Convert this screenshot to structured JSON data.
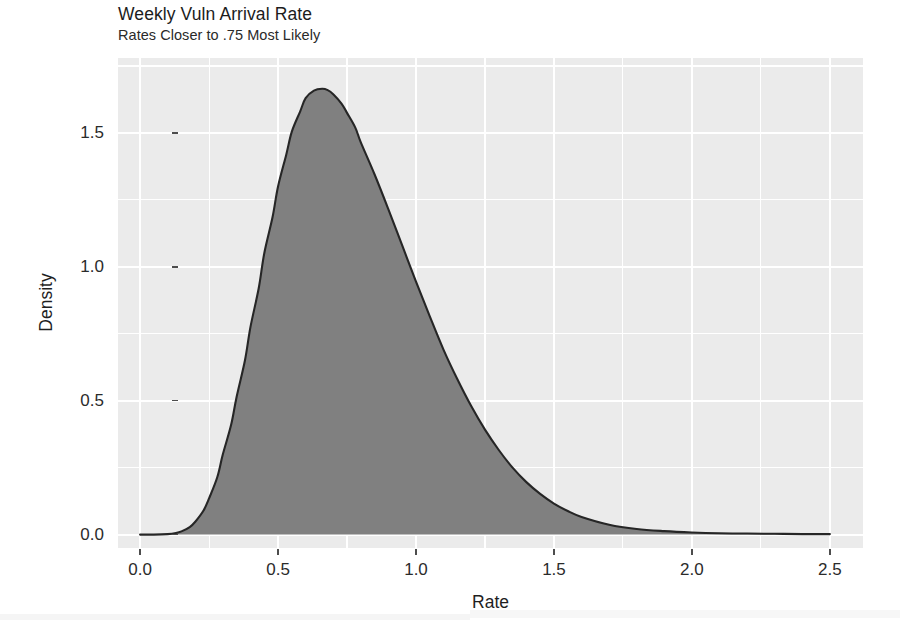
{
  "chart_data": {
    "type": "area",
    "title": "Weekly Vuln Arrival Rate",
    "subtitle": "Rates Closer to .75 Most Likely",
    "xlabel": "Rate",
    "ylabel": "Density",
    "xlim": [
      -0.08,
      2.62
    ],
    "ylim": [
      -0.05,
      1.78
    ],
    "xticks": [
      0.0,
      0.5,
      1.0,
      1.5,
      2.0,
      2.5
    ],
    "xticklabels": [
      "0.0",
      "0.5",
      "1.0",
      "1.5",
      "2.0",
      "2.5"
    ],
    "yticks": [
      0.0,
      0.5,
      1.0,
      1.5
    ],
    "yticklabels": [
      "0.0",
      "0.5",
      "1.0",
      "1.5"
    ],
    "grid": true,
    "minor_grid": true,
    "legend": "none",
    "fill_color": "#808080",
    "line_color": "#262626",
    "panel_background": "#ebebeb",
    "gridline_color": "#ffffff",
    "peak": {
      "x": 0.66,
      "y": 1.66
    },
    "annotation": "Posterior density of weekly vulnerability arrival rate; mode near 0.75",
    "x": [
      0.0,
      0.05,
      0.1,
      0.13,
      0.15,
      0.18,
      0.2,
      0.23,
      0.25,
      0.28,
      0.3,
      0.33,
      0.35,
      0.38,
      0.4,
      0.43,
      0.45,
      0.48,
      0.5,
      0.53,
      0.55,
      0.58,
      0.6,
      0.63,
      0.66,
      0.68,
      0.7,
      0.73,
      0.75,
      0.78,
      0.8,
      0.85,
      0.9,
      0.95,
      1.0,
      1.05,
      1.1,
      1.15,
      1.2,
      1.25,
      1.3,
      1.35,
      1.4,
      1.45,
      1.5,
      1.55,
      1.6,
      1.7,
      1.8,
      1.9,
      2.0,
      2.1,
      2.2,
      2.3,
      2.4,
      2.5
    ],
    "y": [
      0.0,
      0.0,
      0.002,
      0.006,
      0.012,
      0.028,
      0.048,
      0.09,
      0.135,
      0.215,
      0.3,
      0.41,
      0.515,
      0.65,
      0.775,
      0.92,
      1.05,
      1.185,
      1.3,
      1.42,
      1.505,
      1.58,
      1.63,
      1.658,
      1.665,
      1.66,
      1.645,
      1.61,
      1.575,
      1.52,
      1.465,
      1.345,
      1.215,
      1.08,
      0.945,
      0.815,
      0.69,
      0.58,
      0.48,
      0.392,
      0.316,
      0.25,
      0.196,
      0.152,
      0.116,
      0.088,
      0.066,
      0.037,
      0.021,
      0.013,
      0.008,
      0.005,
      0.004,
      0.003,
      0.002,
      0.002
    ]
  },
  "header": {
    "title": "Weekly Vuln Arrival Rate",
    "subtitle": "Rates Closer to .75 Most Likely"
  },
  "axes": {
    "x_title": "Rate",
    "y_title": "Density",
    "x_tick_labels": [
      "0.0",
      "0.5",
      "1.0",
      "1.5",
      "2.0",
      "2.5"
    ],
    "y_tick_labels": [
      "0.0",
      "0.5",
      "1.0",
      "1.5"
    ]
  }
}
